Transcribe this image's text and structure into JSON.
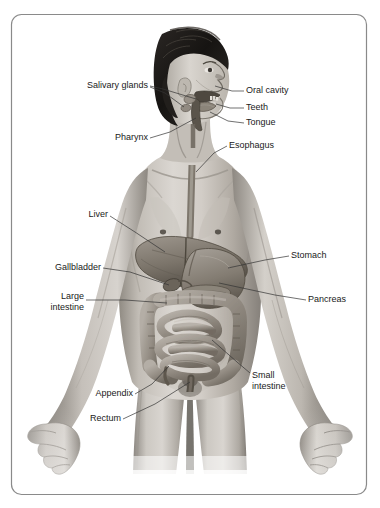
{
  "figure": {
    "background_color": "#ffffff",
    "frame": {
      "border_color": "#8a8a8a",
      "corner_radius": 10,
      "x": 11,
      "y": 14,
      "width": 356,
      "height": 481
    },
    "label_color": "#1a1a1a",
    "leader_color": "#333333",
    "label_font_size": 9
  },
  "labels": [
    {
      "id": "salivary-glands",
      "text": "Salivary glands",
      "lines": [
        "Salivary glands"
      ],
      "side": "left",
      "text_x": 148,
      "text_y": 86,
      "anchor": "end",
      "leaders": [
        [
          [
            150,
            86
          ],
          [
            163,
            89
          ],
          [
            196,
            99
          ]
        ],
        [
          [
            150,
            87
          ],
          [
            165,
            93
          ],
          [
            184,
            107
          ]
        ]
      ]
    },
    {
      "id": "oral-cavity",
      "text": "Oral cavity",
      "lines": [
        "Oral cavity"
      ],
      "side": "right",
      "text_x": 246,
      "text_y": 91,
      "anchor": "start",
      "leaders": [
        [
          [
            244,
            91
          ],
          [
            232,
            91
          ],
          [
            215,
            86
          ]
        ]
      ]
    },
    {
      "id": "teeth",
      "text": "Teeth",
      "lines": [
        "Teeth"
      ],
      "side": "right",
      "text_x": 246,
      "text_y": 108,
      "anchor": "start",
      "leaders": [
        [
          [
            244,
            108
          ],
          [
            230,
            108
          ],
          [
            216,
            104
          ]
        ]
      ]
    },
    {
      "id": "tongue",
      "text": "Tongue",
      "lines": [
        "Tongue"
      ],
      "side": "right",
      "text_x": 246,
      "text_y": 123,
      "anchor": "start",
      "leaders": [
        [
          [
            244,
            123
          ],
          [
            228,
            121
          ],
          [
            210,
            112
          ]
        ]
      ]
    },
    {
      "id": "pharynx",
      "text": "Pharynx",
      "lines": [
        "Pharynx"
      ],
      "side": "left",
      "text_x": 148,
      "text_y": 138,
      "anchor": "end",
      "leaders": [
        [
          [
            150,
            138
          ],
          [
            170,
            132
          ],
          [
            196,
            118
          ]
        ]
      ]
    },
    {
      "id": "esophagus",
      "text": "Esophagus",
      "lines": [
        "Esophagus"
      ],
      "side": "right",
      "text_x": 229,
      "text_y": 146,
      "anchor": "start",
      "leaders": [
        [
          [
            227,
            146
          ],
          [
            214,
            153
          ],
          [
            196,
            172
          ]
        ]
      ]
    },
    {
      "id": "liver",
      "text": "Liver",
      "lines": [
        "Liver"
      ],
      "side": "left",
      "text_x": 108,
      "text_y": 215,
      "anchor": "end",
      "leaders": [
        [
          [
            110,
            216
          ],
          [
            135,
            232
          ],
          [
            165,
            252
          ]
        ]
      ]
    },
    {
      "id": "stomach",
      "text": "Stomach",
      "lines": [
        "Stomach"
      ],
      "side": "right",
      "text_x": 291,
      "text_y": 256,
      "anchor": "start",
      "leaders": [
        [
          [
            289,
            256
          ],
          [
            265,
            260
          ],
          [
            228,
            268
          ]
        ]
      ]
    },
    {
      "id": "gallbladder",
      "text": "Gallbladder",
      "lines": [
        "Gallbladder"
      ],
      "side": "left",
      "text_x": 101,
      "text_y": 268,
      "anchor": "end",
      "leaders": [
        [
          [
            103,
            268
          ],
          [
            130,
            272
          ],
          [
            169,
            285
          ]
        ]
      ]
    },
    {
      "id": "pancreas",
      "text": "Pancreas",
      "lines": [
        "Pancreas"
      ],
      "side": "right",
      "text_x": 308,
      "text_y": 300,
      "anchor": "start",
      "leaders": [
        [
          [
            306,
            300
          ],
          [
            275,
            295
          ],
          [
            219,
            283
          ]
        ]
      ]
    },
    {
      "id": "large-intestine",
      "text": "Large intestine",
      "lines": [
        "Large",
        "intestine"
      ],
      "side": "left",
      "text_x": 84,
      "text_y": 297,
      "anchor": "end",
      "leaders": [
        [
          [
            86,
            300
          ],
          [
            125,
            300
          ],
          [
            167,
            303
          ]
        ]
      ]
    },
    {
      "id": "small-intestine",
      "text": "Small intestine",
      "lines": [
        "Small",
        "intestine"
      ],
      "side": "right",
      "text_x": 252,
      "text_y": 376,
      "anchor": "start",
      "leaders": [
        [
          [
            250,
            373
          ],
          [
            237,
            362
          ],
          [
            212,
            340
          ]
        ]
      ]
    },
    {
      "id": "appendix",
      "text": "Appendix",
      "lines": [
        "Appendix"
      ],
      "side": "left",
      "text_x": 133,
      "text_y": 394,
      "anchor": "end",
      "leaders": [
        [
          [
            135,
            394
          ],
          [
            152,
            384
          ],
          [
            169,
            366
          ]
        ]
      ]
    },
    {
      "id": "rectum",
      "text": "Rectum",
      "lines": [
        "Rectum"
      ],
      "side": "left",
      "text_x": 121,
      "text_y": 419,
      "anchor": "end",
      "leaders": [
        [
          [
            123,
            419
          ],
          [
            155,
            404
          ],
          [
            190,
            382
          ]
        ]
      ]
    }
  ],
  "organs": [
    {
      "id": "liver",
      "name": "Liver"
    },
    {
      "id": "gallbladder",
      "name": "Gallbladder"
    },
    {
      "id": "stomach",
      "name": "Stomach"
    },
    {
      "id": "pancreas",
      "name": "Pancreas"
    },
    {
      "id": "large-intestine",
      "name": "Large intestine"
    },
    {
      "id": "small-intestine",
      "name": "Small intestine"
    },
    {
      "id": "appendix",
      "name": "Appendix"
    },
    {
      "id": "rectum",
      "name": "Rectum"
    },
    {
      "id": "esophagus",
      "name": "Esophagus"
    },
    {
      "id": "pharynx",
      "name": "Pharynx"
    },
    {
      "id": "oral-cavity",
      "name": "Oral cavity"
    },
    {
      "id": "teeth",
      "name": "Teeth"
    },
    {
      "id": "tongue",
      "name": "Tongue"
    },
    {
      "id": "salivary-glands",
      "name": "Salivary glands"
    }
  ],
  "palette": {
    "skin_light": "#d8d4cf",
    "skin_mid": "#b3aea7",
    "skin_shadow": "#8e8982",
    "skin_deep": "#6d685f",
    "hair_dark": "#1e1c1a",
    "hair_mid": "#3b3733",
    "organ_light": "#a9a39b",
    "organ_mid": "#8b8479",
    "organ_dark": "#5f594f",
    "organ_darkest": "#3a352e",
    "outline": "#4a453e"
  }
}
